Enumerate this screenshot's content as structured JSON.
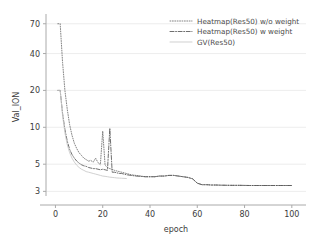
{
  "chart_data": {
    "type": "line",
    "title": "",
    "xlabel": "epoch",
    "ylabel": "Val_ION",
    "yscale": "log",
    "xlim": [
      -4,
      106
    ],
    "ylim": [
      2.75,
      78
    ],
    "grid": true,
    "grid_axis": "y",
    "legend_position": "upper right",
    "xticks": [
      0,
      20,
      40,
      60,
      80,
      100
    ],
    "xtick_labels": [
      "0",
      "20",
      "40",
      "60",
      "80",
      "100"
    ],
    "yticks": [
      3,
      5,
      10,
      20,
      40,
      70
    ],
    "ytick_labels": [
      "3",
      "5",
      "10",
      "20",
      "40",
      "70"
    ],
    "series": [
      {
        "name": "Heatmap(Res50) w/o weight",
        "linestyle": "dotted",
        "color": "#6e6e6e",
        "x": [
          1,
          2,
          3,
          4,
          5,
          6,
          7,
          8,
          9,
          10,
          11,
          12,
          13,
          14,
          15,
          16,
          17,
          18,
          19,
          20,
          21,
          22,
          23,
          24,
          25,
          26,
          27,
          28,
          29,
          30,
          32,
          34,
          36,
          38,
          40,
          42,
          44,
          46,
          48,
          50,
          52,
          54,
          56,
          58,
          60,
          62,
          64,
          66,
          68,
          70,
          74,
          78,
          82,
          86,
          90,
          94,
          98,
          100
        ],
        "y": [
          70.0,
          70.0,
          34.0,
          20.0,
          14.0,
          10.5,
          8.6,
          7.4,
          6.7,
          6.2,
          5.9,
          5.6,
          5.45,
          5.3,
          5.35,
          5.2,
          5.6,
          5.15,
          4.95,
          9.3,
          4.9,
          4.7,
          4.6,
          4.55,
          4.45,
          4.4,
          4.35,
          4.3,
          4.25,
          4.2,
          4.1,
          4.05,
          4.0,
          3.95,
          3.95,
          3.95,
          4.0,
          4.0,
          4.05,
          4.05,
          4.0,
          3.95,
          3.9,
          3.8,
          3.5,
          3.4,
          3.4,
          3.38,
          3.38,
          3.37,
          3.36,
          3.36,
          3.35,
          3.35,
          3.35,
          3.35,
          3.35,
          3.35
        ]
      },
      {
        "name": "Heatmap(Res50) w weight",
        "linestyle": "dashdot",
        "color": "#555555",
        "x": [
          1,
          2,
          3,
          4,
          5,
          6,
          7,
          8,
          9,
          10,
          11,
          12,
          13,
          14,
          15,
          16,
          17,
          18,
          19,
          20,
          21,
          22,
          23,
          24,
          25,
          26,
          27,
          28,
          29,
          30,
          32,
          34,
          36,
          38,
          40,
          42,
          44,
          46,
          48,
          50,
          52,
          54,
          56,
          58,
          60,
          62,
          64,
          66,
          68,
          70,
          74,
          78,
          82,
          86,
          90,
          94,
          98,
          100
        ],
        "y": [
          20.0,
          20.0,
          13.0,
          9.6,
          7.7,
          6.6,
          6.0,
          5.6,
          5.3,
          5.1,
          4.95,
          4.85,
          4.8,
          4.7,
          4.65,
          4.6,
          4.6,
          4.55,
          4.5,
          4.55,
          4.5,
          4.45,
          9.8,
          4.3,
          4.3,
          4.25,
          4.2,
          4.2,
          4.15,
          4.1,
          4.05,
          4.0,
          3.98,
          3.95,
          3.95,
          3.95,
          4.0,
          4.0,
          4.05,
          4.05,
          4.0,
          3.95,
          3.9,
          3.8,
          3.5,
          3.4,
          3.4,
          3.38,
          3.38,
          3.37,
          3.36,
          3.36,
          3.35,
          3.35,
          3.35,
          3.35,
          3.35,
          3.35
        ]
      },
      {
        "name": "GV(Res50)",
        "linestyle": "solid",
        "color": "#c8c8c8",
        "x": [
          1,
          2,
          3,
          4,
          5,
          6,
          7,
          8,
          9,
          10,
          11,
          12,
          13,
          14,
          15,
          16,
          17,
          18,
          19,
          20,
          21,
          22,
          23,
          24,
          25,
          26,
          27,
          28,
          29,
          30
        ],
        "y": [
          20.0,
          20.0,
          12.5,
          9.0,
          7.2,
          6.2,
          5.6,
          5.2,
          4.9,
          4.7,
          4.55,
          4.45,
          4.35,
          4.3,
          4.25,
          4.2,
          4.15,
          4.1,
          4.05,
          4.0,
          3.98,
          3.95,
          3.92,
          3.9,
          3.88,
          3.86,
          3.85,
          3.84,
          3.83,
          3.82
        ]
      }
    ]
  },
  "legend": {
    "entries": [
      {
        "label": "Heatmap(Res50) w/o weight"
      },
      {
        "label": "Heatmap(Res50) w weight"
      },
      {
        "label": "GV(Res50)"
      }
    ]
  },
  "axes": {
    "x_title": "epoch",
    "y_title": "Val_ION"
  },
  "colors": {
    "background": "#ffffff",
    "grid": "#e9e9e9",
    "spine": "#aaaaaa",
    "text": "#3b3b3b"
  }
}
